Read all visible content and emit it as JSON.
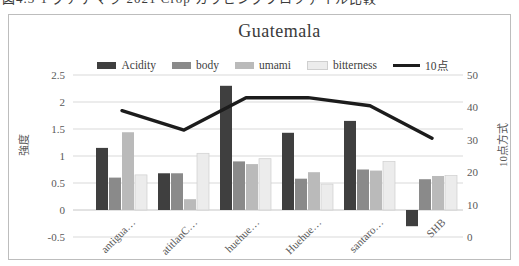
{
  "caption_fragment": "図4.3-1 グアテマラ 2021 Crop カッピングプロファイル比較",
  "chart_data": {
    "type": "bar",
    "subtype": "grouped-bars-with-secondary-axis-line",
    "title": "Guatemala",
    "categories": [
      "antigua…",
      "atitlanC…",
      "huehue…",
      "Huehue…",
      "santaro…",
      "SHB"
    ],
    "series": [
      {
        "name": "Acidity",
        "type": "bar",
        "axis": "left",
        "color": "#3f3f3f",
        "values": [
          1.15,
          0.68,
          2.3,
          1.43,
          1.65,
          -0.3
        ]
      },
      {
        "name": "body",
        "type": "bar",
        "axis": "left",
        "color": "#8a8a8a",
        "values": [
          0.6,
          0.68,
          0.9,
          0.58,
          0.75,
          0.57
        ]
      },
      {
        "name": "umami",
        "type": "bar",
        "axis": "left",
        "color": "#bababa",
        "values": [
          1.44,
          0.2,
          0.85,
          0.7,
          0.73,
          0.63
        ]
      },
      {
        "name": "bitterness",
        "type": "bar",
        "axis": "left",
        "color": "#ececec",
        "stroke": "#cfcfcf",
        "values": [
          0.65,
          1.05,
          0.95,
          0.48,
          0.9,
          0.64
        ]
      },
      {
        "name": "10点",
        "type": "line",
        "axis": "right",
        "color": "#1c1c1c",
        "values": [
          39,
          33,
          43,
          43,
          40.5,
          30.5
        ]
      }
    ],
    "left_axis": {
      "title": "強度",
      "min": -0.5,
      "max": 2.5,
      "ticks": [
        "2.5",
        "2",
        "1.5",
        "1",
        "0.5",
        "0",
        "-0.5"
      ]
    },
    "right_axis": {
      "title": "10点方式",
      "min": 0,
      "max": 50,
      "ticks": [
        "50",
        "40",
        "30",
        "20",
        "10",
        "0"
      ]
    },
    "legend_position": "top",
    "grid": true,
    "gridline_color": "#d9d9d9",
    "baseline_color": "#c6c6c6",
    "text_color": "#595959",
    "title_color": "#3a3a3a",
    "border_color": "#bdbdbd"
  }
}
